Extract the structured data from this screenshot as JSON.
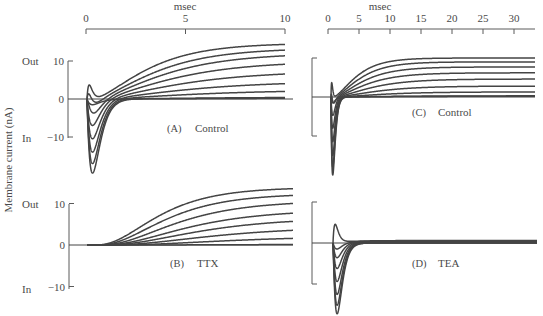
{
  "chart_data": [
    {
      "id": "A",
      "type": "line",
      "panel_letter": "(A)",
      "title": "Control",
      "xlabel": "msec",
      "ylabel": "Membrane current (nA)",
      "x_ticks": [
        0,
        5,
        10
      ],
      "xlim": [
        0,
        10
      ],
      "y_ticks": [
        10,
        0,
        -10
      ],
      "ylim": [
        -20,
        15
      ],
      "y_direction_labels": {
        "out": "Out",
        "in": "In"
      },
      "series": [
        {
          "name": "trace-1",
          "inward_peak": -0.5,
          "early_hump": 4.5,
          "steady_state": 14.7,
          "tau_ms": 2.2
        },
        {
          "name": "trace-2",
          "inward_peak": -2.0,
          "early_hump": 3.0,
          "steady_state": 13.4,
          "tau_ms": 2.5
        },
        {
          "name": "trace-3",
          "inward_peak": -4.5,
          "early_hump": 1.5,
          "steady_state": 12.1,
          "tau_ms": 2.8
        },
        {
          "name": "trace-4",
          "inward_peak": -7.0,
          "early_hump": 0.0,
          "steady_state": 10.0,
          "tau_ms": 3.1
        },
        {
          "name": "trace-5",
          "inward_peak": -10.5,
          "early_hump": 0.0,
          "steady_state": 7.4,
          "tau_ms": 3.4
        },
        {
          "name": "trace-6",
          "inward_peak": -14.0,
          "early_hump": 0.0,
          "steady_state": 4.7,
          "tau_ms": 3.7
        },
        {
          "name": "trace-7",
          "inward_peak": -17.0,
          "early_hump": 0.0,
          "steady_state": 2.4,
          "tau_ms": 4.0
        },
        {
          "name": "trace-8",
          "inward_peak": -19.5,
          "early_hump": 0.0,
          "steady_state": 0.5,
          "tau_ms": 4.5
        },
        {
          "name": "trace-9",
          "inward_peak": -1.5,
          "early_hump": 0.0,
          "steady_state": 0.3,
          "tau_ms": 6.0
        }
      ]
    },
    {
      "id": "B",
      "type": "line",
      "panel_letter": "(B)",
      "title": "TTX",
      "x_ticks": [],
      "xlim": [
        0,
        10
      ],
      "y_ticks": [
        10,
        0,
        -10
      ],
      "ylim": [
        -10,
        15
      ],
      "y_direction_labels": {
        "out": "Out",
        "in": "In"
      },
      "series": [
        {
          "name": "trace-1",
          "steady_state": 13.9,
          "delay_ms": 0.9,
          "tau_ms": 2.0
        },
        {
          "name": "trace-2",
          "steady_state": 12.4,
          "delay_ms": 1.1,
          "tau_ms": 2.2
        },
        {
          "name": "trace-3",
          "steady_state": 10.7,
          "delay_ms": 1.3,
          "tau_ms": 2.5
        },
        {
          "name": "trace-4",
          "steady_state": 8.5,
          "delay_ms": 1.5,
          "tau_ms": 2.8
        },
        {
          "name": "trace-5",
          "steady_state": 6.6,
          "delay_ms": 1.7,
          "tau_ms": 3.1
        },
        {
          "name": "trace-6",
          "steady_state": 4.4,
          "delay_ms": 2.0,
          "tau_ms": 3.5
        },
        {
          "name": "trace-7",
          "steady_state": 2.2,
          "delay_ms": 2.4,
          "tau_ms": 4.0
        },
        {
          "name": "trace-8",
          "steady_state": 0.2,
          "delay_ms": 3.0,
          "tau_ms": 5.0
        }
      ]
    },
    {
      "id": "C",
      "type": "line",
      "panel_letter": "(C)",
      "title": "Control",
      "xlabel": "msec",
      "x_ticks": [
        0,
        5,
        10,
        15,
        20,
        25,
        30
      ],
      "xlim": [
        0,
        33
      ],
      "y_scale_bracket": [
        -10,
        10
      ],
      "ylim": [
        -20,
        15
      ],
      "series": [
        {
          "name": "trace-1",
          "inward_peak": -0.5,
          "early_hump": 4.5,
          "steady_state": 10.0,
          "tau_ms": 3.0
        },
        {
          "name": "trace-2",
          "inward_peak": -2.5,
          "early_hump": 2.5,
          "steady_state": 9.0,
          "tau_ms": 3.4
        },
        {
          "name": "trace-3",
          "inward_peak": -5.0,
          "early_hump": 0.5,
          "steady_state": 7.7,
          "tau_ms": 3.8
        },
        {
          "name": "trace-4",
          "inward_peak": -8.0,
          "early_hump": 0.0,
          "steady_state": 6.2,
          "tau_ms": 4.2
        },
        {
          "name": "trace-5",
          "inward_peak": -11.5,
          "early_hump": 0.0,
          "steady_state": 4.6,
          "tau_ms": 4.8
        },
        {
          "name": "trace-6",
          "inward_peak": -15.0,
          "early_hump": 0.0,
          "steady_state": 2.8,
          "tau_ms": 5.4
        },
        {
          "name": "trace-7",
          "inward_peak": -18.0,
          "early_hump": 0.0,
          "steady_state": 1.3,
          "tau_ms": 6.0
        },
        {
          "name": "trace-8",
          "inward_peak": -20.0,
          "early_hump": 0.0,
          "steady_state": 0.3,
          "tau_ms": 7.0
        },
        {
          "name": "trace-9",
          "inward_peak": -1.5,
          "early_hump": 0.0,
          "steady_state": 0.2,
          "tau_ms": 8.0
        }
      ]
    },
    {
      "id": "D",
      "type": "line",
      "panel_letter": "(D)",
      "title": "TEA",
      "x_ticks": [],
      "xlim": [
        0,
        33
      ],
      "y_scale_bracket": [
        -10,
        10
      ],
      "ylim": [
        -17,
        10
      ],
      "series": [
        {
          "name": "trace-1",
          "inward_peak": 0.0,
          "early_hump": 4.5,
          "steady_state": 0.6,
          "tau_ms": 1.2
        },
        {
          "name": "trace-2",
          "inward_peak": -1.5,
          "early_hump": 0.0,
          "steady_state": 0.5,
          "tau_ms": 1.6
        },
        {
          "name": "trace-3",
          "inward_peak": -3.5,
          "early_hump": 0.0,
          "steady_state": 0.4,
          "tau_ms": 2.0
        },
        {
          "name": "trace-4",
          "inward_peak": -6.0,
          "early_hump": 0.0,
          "steady_state": 0.3,
          "tau_ms": 2.4
        },
        {
          "name": "trace-5",
          "inward_peak": -9.0,
          "early_hump": 0.0,
          "steady_state": 0.2,
          "tau_ms": 2.8
        },
        {
          "name": "trace-6",
          "inward_peak": -12.0,
          "early_hump": 0.0,
          "steady_state": 0.1,
          "tau_ms": 3.3
        },
        {
          "name": "trace-7",
          "inward_peak": -14.5,
          "early_hump": 0.0,
          "steady_state": 0.0,
          "tau_ms": 3.8
        },
        {
          "name": "trace-8",
          "inward_peak": -16.5,
          "early_hump": 0.0,
          "steady_state": 0.0,
          "tau_ms": 4.4
        }
      ]
    }
  ],
  "figure": {
    "ylabel": "Membrane current (nA)",
    "xlabel": "msec"
  }
}
